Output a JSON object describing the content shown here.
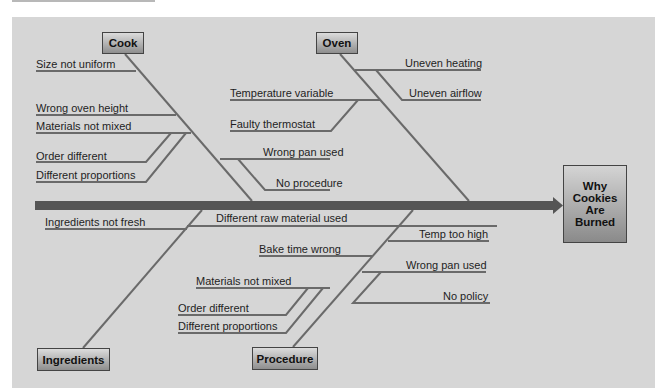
{
  "effect": {
    "lines": [
      "Why",
      "Cookies",
      "Are",
      "Burned"
    ]
  },
  "categories": {
    "cook": "Cook",
    "oven": "Oven",
    "ingredients": "Ingredients",
    "procedure": "Procedure"
  },
  "causes": {
    "cook": [
      "Size not uniform",
      "Wrong oven height",
      "Materials not mixed",
      "Order different",
      "Different proportions",
      "Wrong pan used",
      "No procedure"
    ],
    "oven": [
      "Uneven heating",
      "Uneven airflow",
      "Temperature variable",
      "Faulty thermostat"
    ],
    "ingredients": [
      "Ingredients not fresh",
      "Different raw material used"
    ],
    "procedure": [
      "Bake time wrong",
      "Materials not mixed",
      "Order different",
      "Different proportions",
      "Temp too high",
      "Wrong pan used",
      "No policy"
    ]
  },
  "colors": {
    "panel": "#d6d6d6",
    "spine": "#555555",
    "bone": "#6a6a6a",
    "box_top": "#dcdcdc",
    "box_bottom": "#8e8e8e"
  }
}
